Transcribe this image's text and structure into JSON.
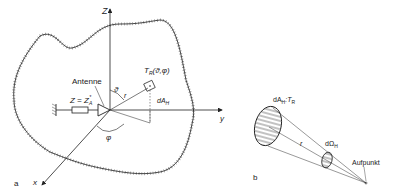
{
  "figure_a": {
    "panel_label": "a",
    "axis_z": "Z",
    "axis_y": "y",
    "axis_x": "x",
    "antenna_label": "Antenne",
    "impedance_label": "Z = Z",
    "impedance_sub": "A",
    "impedance_sup": "*",
    "temp_label": "T",
    "temp_sub": "R",
    "temp_args": "(ϑ,φ)",
    "theta": "ϑ",
    "phi": "φ",
    "r": "r",
    "area_label": "dA",
    "area_sub": "H"
  },
  "figure_b": {
    "panel_label": "b",
    "area_temp_label": "dA",
    "area_temp_sub": "H",
    "area_temp_sep": ":T",
    "area_temp_sub2": "R",
    "solid_angle_label": "dΩ",
    "solid_angle_sub": "H",
    "r": "r",
    "point_label": "Aufpunkt"
  }
}
